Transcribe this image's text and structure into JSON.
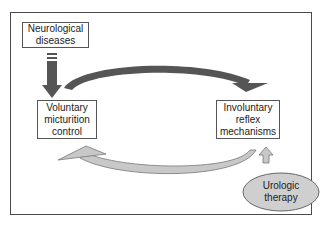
{
  "diagram": {
    "nodes": {
      "neurological": {
        "line1": "Neurological",
        "line2": "diseases"
      },
      "voluntary": {
        "line1": "Voluntary",
        "line2": "micturition",
        "line3": "control"
      },
      "involuntary": {
        "line1": "Involuntary",
        "line2": "reflex",
        "line3": "mechanisms"
      },
      "therapy": {
        "line1": "Urologic",
        "line2": "therapy"
      }
    },
    "edges": [
      {
        "from": "neurological",
        "to": "voluntary",
        "style": "dark straight arrow"
      },
      {
        "from": "voluntary",
        "to": "involuntary",
        "style": "dark curved arrow (top)"
      },
      {
        "from": "involuntary",
        "to": "voluntary",
        "style": "light curved arrow (bottom)"
      },
      {
        "from": "therapy",
        "to": "involuntary",
        "style": "light straight arrow"
      }
    ],
    "colors": {
      "dark_arrow": "#555555",
      "light_arrow": "#c8c8c8",
      "ellipse_fill": "#cfcfcf",
      "border": "#555555"
    }
  }
}
